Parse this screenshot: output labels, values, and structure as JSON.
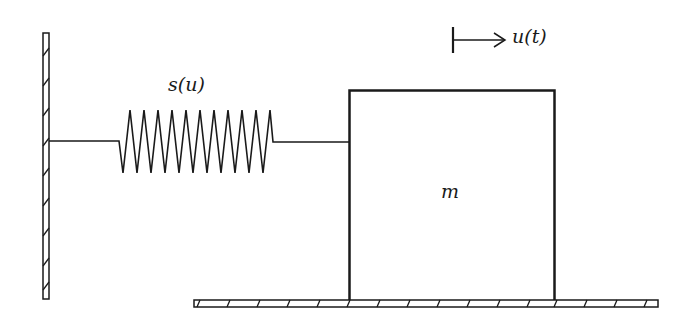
{
  "diagram": {
    "type": "mass-spring system",
    "labels": {
      "spring": "s(u)",
      "mass": "m",
      "displacement": "u(t)"
    },
    "components": {
      "wall": {
        "x": 43,
        "y_top": 33,
        "y_bottom": 299,
        "width": 6,
        "hatched": true
      },
      "spring": {
        "x_start": 49,
        "x_coil_start": 121,
        "x_coil_end": 272,
        "x_end": 349,
        "y": 141,
        "peaks": 11,
        "peak_y": 110,
        "trough_y": 173
      },
      "mass_block": {
        "x": 349,
        "y": 90,
        "width": 206,
        "height": 212
      },
      "floor": {
        "x_start": 194,
        "x_end": 658,
        "y": 300,
        "height": 7,
        "hatched": true
      },
      "displacement_arrow": {
        "x_start": 453,
        "x_end": 506,
        "y": 40
      }
    },
    "colors": {
      "stroke": "#1a1a1a",
      "background": "#ffffff"
    }
  }
}
